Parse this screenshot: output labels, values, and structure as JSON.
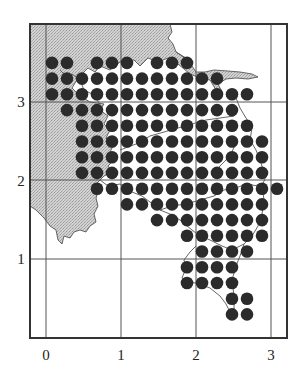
{
  "chart_data": {
    "type": "scatter",
    "title": "",
    "xlabel": "",
    "ylabel": "",
    "xlim": [
      -0.2,
      3.2
    ],
    "ylim": [
      0,
      4.0
    ],
    "x_ticks": [
      "0",
      "1",
      "2",
      "3"
    ],
    "y_ticks": [
      "1",
      "2",
      "3"
    ],
    "grid": true,
    "dot_spacing": 0.2,
    "colors": {
      "dot": "#2b2b2b",
      "shade": "#c8c8c8",
      "frame": "#333333",
      "grid": "#555555"
    },
    "rows": [
      {
        "y": 3.5,
        "cols": [
          0,
          1,
          3,
          4,
          5,
          7,
          8,
          9
        ]
      },
      {
        "y": 3.3,
        "cols": [
          0,
          1,
          2,
          3,
          4,
          5,
          6,
          7,
          8,
          9,
          10,
          11
        ]
      },
      {
        "y": 3.1,
        "cols": [
          0,
          1,
          2,
          3,
          4,
          5,
          6,
          7,
          8,
          9,
          10,
          11,
          12,
          13
        ]
      },
      {
        "y": 2.9,
        "cols": [
          1,
          2,
          3,
          4,
          5,
          6,
          7,
          8,
          9,
          10,
          11,
          12
        ]
      },
      {
        "y": 2.7,
        "cols": [
          2,
          3,
          4,
          5,
          6,
          7,
          8,
          9,
          10,
          11,
          12,
          13
        ]
      },
      {
        "y": 2.5,
        "cols": [
          2,
          3,
          4,
          5,
          6,
          7,
          8,
          9,
          10,
          11,
          12,
          13,
          14
        ]
      },
      {
        "y": 2.3,
        "cols": [
          2,
          3,
          4,
          5,
          6,
          7,
          8,
          9,
          10,
          11,
          12,
          13,
          14
        ]
      },
      {
        "y": 2.1,
        "cols": [
          2,
          3,
          4,
          5,
          6,
          7,
          8,
          9,
          10,
          11,
          12,
          13,
          14
        ]
      },
      {
        "y": 1.9,
        "cols": [
          3,
          4,
          5,
          6,
          7,
          8,
          9,
          10,
          11,
          12,
          13,
          14,
          15
        ]
      },
      {
        "y": 1.7,
        "cols": [
          5,
          6,
          7,
          8,
          9,
          10,
          11,
          12,
          13,
          14
        ]
      },
      {
        "y": 1.5,
        "cols": [
          7,
          8,
          9,
          10,
          11,
          12,
          13,
          14
        ]
      },
      {
        "y": 1.3,
        "cols": [
          9,
          10,
          11,
          12,
          13,
          14
        ]
      },
      {
        "y": 1.1,
        "cols": [
          10,
          11,
          12,
          13
        ]
      },
      {
        "y": 0.9,
        "cols": [
          9,
          10,
          11,
          12
        ]
      },
      {
        "y": 0.7,
        "cols": [
          9,
          10,
          11,
          12
        ]
      },
      {
        "y": 0.5,
        "cols": [
          12,
          13
        ]
      },
      {
        "y": 0.3,
        "cols": [
          12,
          13
        ]
      }
    ],
    "col_x0": 0.08,
    "total_points": 163
  },
  "axes": {
    "x_labels": [
      "0",
      "1",
      "2",
      "3"
    ],
    "y_labels": [
      "3",
      "2",
      "1"
    ]
  }
}
